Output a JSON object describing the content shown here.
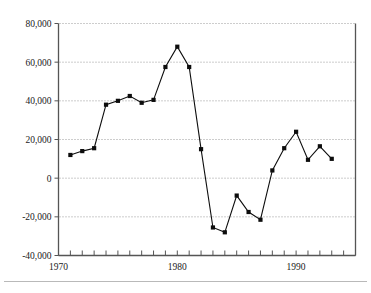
{
  "chart_data": {
    "type": "line",
    "title": "",
    "subtitle": "",
    "xlabel": "",
    "ylabel": "",
    "xlim": [
      1970,
      1995
    ],
    "ylim": [
      -40000,
      80000
    ],
    "grid": "horizontal-dotted",
    "legend": "none",
    "marker": "square",
    "line_color": "#0d0d0d",
    "grid_color": "#808080",
    "axis_color": "#555555",
    "x": [
      1971,
      1972,
      1973,
      1974,
      1975,
      1976,
      1977,
      1978,
      1979,
      1980,
      1981,
      1982,
      1983,
      1984,
      1985,
      1986,
      1987,
      1988,
      1989,
      1990,
      1991,
      1992,
      1993
    ],
    "values": [
      12000,
      14000,
      15500,
      38000,
      40000,
      42500,
      39000,
      40500,
      57500,
      68000,
      57500,
      15000,
      -25500,
      -28000,
      -9000,
      -17500,
      -21500,
      4000,
      15500,
      24000,
      9500,
      16500,
      10000
    ],
    "series": [
      {
        "name": "series-1",
        "values": [
          12000,
          14000,
          15500,
          38000,
          40000,
          42500,
          39000,
          40500,
          57500,
          68000,
          57500,
          15000,
          -25500,
          -28000,
          -9000,
          -17500,
          -21500,
          4000,
          15500,
          24000,
          9500,
          16500,
          10000
        ]
      }
    ],
    "y_ticks": [
      -40000,
      -20000,
      0,
      20000,
      40000,
      60000,
      80000
    ],
    "y_tick_labels": [
      "-40,000",
      "-20,000",
      "0",
      "20,000",
      "40,000",
      "60,000",
      "80,000"
    ],
    "x_ticks": [
      1970,
      1971,
      1972,
      1973,
      1974,
      1975,
      1976,
      1977,
      1978,
      1979,
      1980,
      1981,
      1982,
      1983,
      1984,
      1985,
      1986,
      1987,
      1988,
      1989,
      1990,
      1991,
      1992,
      1993,
      1994,
      1995
    ],
    "x_tick_labels_shown": [
      {
        "value": 1970,
        "label": "1970"
      },
      {
        "value": 1980,
        "label": "1980"
      },
      {
        "value": 1990,
        "label": "1990"
      }
    ]
  }
}
